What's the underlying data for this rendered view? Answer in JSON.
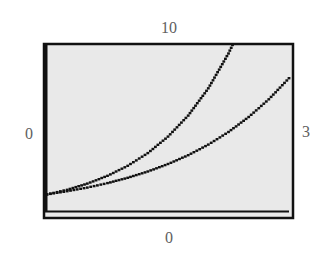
{
  "chart_data": {
    "type": "line",
    "title": "",
    "xlabel": "",
    "ylabel": "",
    "xlim": [
      0,
      3
    ],
    "ylim": [
      0,
      10
    ],
    "grid": false,
    "legend": null,
    "window_labels": {
      "ymax": "10",
      "ymin": "0",
      "xmin": "0",
      "xmax": "3"
    },
    "series": [
      {
        "name": "y = e^x",
        "style": "dotted",
        "x": [
          0,
          0.25,
          0.5,
          0.75,
          1.0,
          1.25,
          1.5,
          1.75,
          2.0,
          2.25,
          2.3
        ],
        "y": [
          1,
          1.28,
          1.65,
          2.12,
          2.72,
          3.49,
          4.48,
          5.75,
          7.39,
          9.49,
          10
        ]
      },
      {
        "name": "y = 2^x",
        "style": "dotted",
        "x": [
          0,
          0.25,
          0.5,
          0.75,
          1.0,
          1.25,
          1.5,
          1.75,
          2.0,
          2.25,
          2.5,
          2.75,
          3.0
        ],
        "y": [
          1,
          1.19,
          1.41,
          1.68,
          2.0,
          2.38,
          2.83,
          3.36,
          4.0,
          4.76,
          5.66,
          6.73,
          8.0
        ]
      }
    ]
  },
  "colors": {
    "screen_bg": "#e9e9e9",
    "frame": "#111111",
    "curve": "#111111",
    "label": "#606060"
  }
}
